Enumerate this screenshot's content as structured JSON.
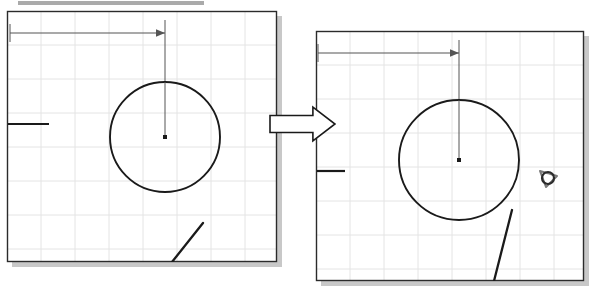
{
  "page": {
    "width": 594,
    "height": 293,
    "background_color": "#ffffff"
  },
  "colors": {
    "paper": "#ffffff",
    "panel_border": "#2b2b2b",
    "grid_line": "#e4e4e4",
    "sketch_line": "#1a1a1a",
    "dimension_line": "#555555",
    "shadow": "#9a9a9a",
    "top_bar": "#8d8d8d",
    "snap_marker": "#7a7a7a",
    "arrow_fill": "#ffffff",
    "arrow_stroke": "#1a1a1a"
  },
  "top_bar": {
    "name": "top-gray-bar",
    "x": 18,
    "y": 1,
    "width": 186,
    "height": 4
  },
  "transition_arrow": {
    "name": "transition-arrow",
    "label": "becomes",
    "direction": "right",
    "x": 270,
    "y": 107,
    "width": 65,
    "height": 34
  },
  "panels": [
    {
      "id": "before",
      "name": "sketch-panel-before",
      "caption": "Before: line intersects circle",
      "frame": {
        "x": 7,
        "y": 11,
        "width": 270,
        "height": 251
      },
      "grid": {
        "spacing_x": 34,
        "spacing_y": 34,
        "visible": true
      },
      "circle": {
        "name": "sketch-circle",
        "cx": 165,
        "cy": 137,
        "r": 55
      },
      "center_point": {
        "name": "circle-center-point",
        "cx": 165,
        "cy": 137,
        "size": 4
      },
      "radius_line": {
        "name": "radius-construction-line",
        "x1": 165,
        "y1": 82,
        "x2": 165,
        "y2": 137
      },
      "dimension": {
        "name": "horizontal-dimension",
        "x1": 10,
        "y1": 33,
        "x2": 165,
        "y2": 33,
        "arrowhead": "right",
        "value": ""
      },
      "vertical_extension": {
        "name": "dimension-extension-line",
        "x1": 165,
        "y1": 20,
        "x2": 165,
        "y2": 82
      },
      "edge_tick": {
        "name": "left-edge-tick",
        "x1": 8,
        "y1": 124,
        "x2": 49,
        "y2": 124
      },
      "tangent_line": {
        "name": "intersecting-line",
        "x1": 203,
        "y1": 223,
        "x2": 172,
        "y2": 262
      },
      "snap_marker": null
    },
    {
      "id": "after",
      "name": "sketch-panel-after",
      "caption": "After: tangent constraint applied",
      "frame": {
        "x": 316,
        "y": 31,
        "width": 268,
        "height": 250
      },
      "grid": {
        "spacing_x": 34,
        "spacing_y": 34,
        "visible": true
      },
      "circle": {
        "name": "sketch-circle",
        "cx": 459,
        "cy": 160,
        "r": 60
      },
      "center_point": {
        "name": "circle-center-point",
        "cx": 459,
        "cy": 160,
        "size": 4
      },
      "radius_line": {
        "name": "radius-construction-line",
        "x1": 459,
        "y1": 100,
        "x2": 459,
        "y2": 160
      },
      "dimension": {
        "name": "horizontal-dimension",
        "x1": 318,
        "y1": 53,
        "x2": 459,
        "y2": 53,
        "arrowhead": "right",
        "value": ""
      },
      "vertical_extension": {
        "name": "dimension-extension-line",
        "x1": 459,
        "y1": 40,
        "x2": 459,
        "y2": 100
      },
      "edge_tick": {
        "name": "left-edge-tick",
        "x1": 317,
        "y1": 171,
        "x2": 345,
        "y2": 171
      },
      "tangent_line": {
        "name": "tangent-line",
        "x1": 512,
        "y1": 210,
        "x2": 494,
        "y2": 281
      },
      "snap_marker": {
        "name": "tangent-snap-marker-icon",
        "cx": 548,
        "cy": 178,
        "r": 6,
        "glyph": "tangent-snap"
      }
    }
  ]
}
